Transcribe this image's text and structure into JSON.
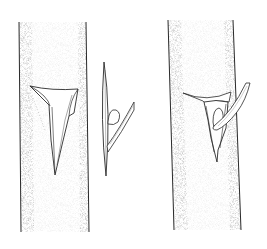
{
  "figure": {
    "title": "T-budding sequence",
    "panels": [
      {
        "id": "stock-with-t-cut",
        "label": "Rootstock with T-shaped incision, bark flaps lifted"
      },
      {
        "id": "bud-shield",
        "label": "Bud shield with leaf stalk (petiole)"
      },
      {
        "id": "bud-inserted",
        "label": "Bud shield inserted under bark flaps of rootstock"
      }
    ]
  },
  "colors": {
    "background": "#ffffff",
    "ink": "#2a2a2a",
    "stipple": "#8a8a8a"
  }
}
